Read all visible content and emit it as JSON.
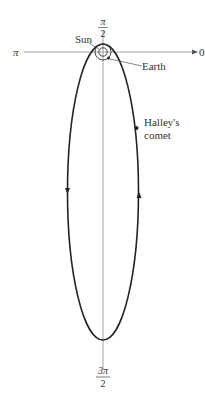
{
  "diagram": {
    "type": "polar-orbit",
    "axis_labels": {
      "angle_0": "0",
      "angle_pi": "π",
      "angle_pi_over_2": {
        "numerator": "π",
        "denominator": "2"
      },
      "angle_3pi_over_2": {
        "numerator": "3π",
        "denominator": "2"
      }
    },
    "annotations": {
      "sun": "Sun",
      "earth": "Earth",
      "comet_line1": "Halley's",
      "comet_line2": "comet"
    },
    "orbit": {
      "shape": "ellipse",
      "direction": "counterclockwise",
      "color": "#222222"
    },
    "axis_color": "#888888"
  }
}
